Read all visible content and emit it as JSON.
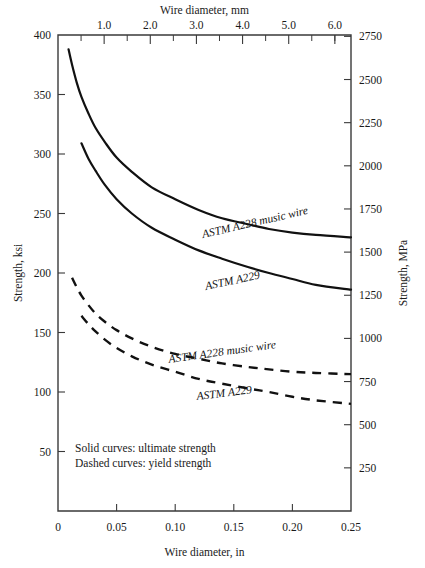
{
  "chart_data": {
    "type": "line",
    "title": "",
    "xlabel": "Wire diameter, in",
    "xlabel_top": "Wire diameter, mm",
    "ylabel": "Strength, ksi",
    "ylabel_right": "Strength, MPa",
    "xlim": [
      0,
      0.25
    ],
    "ylim": [
      0,
      400
    ],
    "xlim_top_mm": [
      0,
      6.35
    ],
    "ylim_right_mpa": [
      0,
      2757.9
    ],
    "grid": false,
    "legend_position": "inline-annotations",
    "xticks": [
      "0",
      "0.05",
      "0.10",
      "0.15",
      "0.20",
      "0.25"
    ],
    "xtick_values": [
      0,
      0.05,
      0.1,
      0.15,
      0.2,
      0.25
    ],
    "yticks": [
      "50",
      "100",
      "150",
      "200",
      "250",
      "300",
      "350",
      "400"
    ],
    "ytick_values": [
      50,
      100,
      150,
      200,
      250,
      300,
      350,
      400
    ],
    "xticks_top": [
      "1.0",
      "2.0",
      "3.0",
      "4.0",
      "5.0",
      "6.0"
    ],
    "xtick_top_values": [
      1.0,
      2.0,
      3.0,
      4.0,
      5.0,
      6.0
    ],
    "xtick_top_minor_values": [
      0.5,
      1.5,
      2.5,
      3.5,
      4.5,
      5.5,
      6.0
    ],
    "yticks_right": [
      "250",
      "500",
      "750",
      "1000",
      "1250",
      "1500",
      "1750",
      "2000",
      "2250",
      "2500",
      "2750"
    ],
    "ytick_right_values": [
      250,
      500,
      750,
      1000,
      1250,
      1500,
      1750,
      2000,
      2250,
      2500,
      2750
    ],
    "series": [
      {
        "name": "ASTM A228 music wire",
        "label": "ASTM A228 music wire",
        "style": "solid",
        "property": "ultimate strength",
        "x": [
          0.009,
          0.012,
          0.016,
          0.02,
          0.026,
          0.032,
          0.04,
          0.05,
          0.063,
          0.08,
          0.1,
          0.12,
          0.14,
          0.162,
          0.18,
          0.2,
          0.22,
          0.25
        ],
        "y": [
          388,
          375,
          360,
          348,
          334,
          322,
          310,
          297,
          285,
          272,
          262,
          253,
          246,
          241,
          237,
          234,
          232,
          230
        ]
      },
      {
        "name": "ASTM A229",
        "label": "ASTM A229",
        "style": "solid",
        "property": "ultimate strength",
        "x": [
          0.02,
          0.026,
          0.032,
          0.04,
          0.05,
          0.063,
          0.08,
          0.1,
          0.12,
          0.14,
          0.162,
          0.18,
          0.2,
          0.22,
          0.25
        ],
        "y": [
          309,
          296,
          286,
          274,
          262,
          250,
          238,
          228,
          219,
          212,
          205,
          200,
          195,
          190,
          186
        ]
      },
      {
        "name": "ASTM A228 music wire (yield)",
        "label": "ASTM A228 music wire",
        "style": "dashed",
        "property": "yield strength",
        "x": [
          0.012,
          0.016,
          0.02,
          0.026,
          0.032,
          0.04,
          0.05,
          0.063,
          0.08,
          0.1,
          0.12,
          0.14,
          0.162,
          0.18,
          0.2,
          0.22,
          0.25
        ],
        "y": [
          196,
          188,
          181,
          173,
          166,
          159,
          152,
          145,
          138,
          132,
          128,
          124,
          121,
          119,
          117,
          116,
          115
        ]
      },
      {
        "name": "ASTM A229 (yield)",
        "label": "ASTM A229",
        "style": "dashed",
        "property": "yield strength",
        "x": [
          0.02,
          0.026,
          0.032,
          0.04,
          0.05,
          0.063,
          0.08,
          0.1,
          0.12,
          0.14,
          0.162,
          0.18,
          0.2,
          0.22,
          0.25
        ],
        "y": [
          164,
          157,
          151,
          144,
          137,
          130,
          123,
          117,
          111,
          107,
          103,
          100,
          96,
          93,
          90
        ]
      }
    ],
    "annotations": [
      "Solid curves: ultimate strength",
      "Dashed curves: yield strength"
    ]
  },
  "notes": {
    "line1": "Solid curves: ultimate strength",
    "line2": "Dashed curves: yield strength"
  },
  "labels": {
    "a228_ultimate": "ASTM A228 music wire",
    "a229_ultimate": "ASTM A229",
    "a228_yield": "ASTM A228 music wire",
    "a229_yield": "ASTM A229"
  },
  "colors": {
    "curve": "#111111",
    "axis": "#3a3a3a",
    "background": "#ffffff"
  }
}
